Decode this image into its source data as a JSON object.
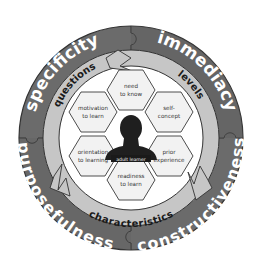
{
  "diagram": {
    "type": "concentric-circle-framework",
    "center_label": "adult learner",
    "outer_ring": {
      "segments": [
        {
          "label": "specificity",
          "position": "top-left"
        },
        {
          "label": "immediacy",
          "position": "top-right"
        },
        {
          "label": "constructiveness",
          "position": "bottom-right"
        },
        {
          "label": "purposefulness",
          "position": "bottom-left"
        }
      ]
    },
    "middle_ring": {
      "labels": [
        {
          "label": "questions",
          "position": "top-left"
        },
        {
          "label": "levels",
          "position": "top-right"
        },
        {
          "label": "characteristics",
          "position": "bottom"
        }
      ]
    },
    "hexagons": [
      {
        "line1": "need",
        "line2": "to know",
        "position": "top"
      },
      {
        "line1": "self-",
        "line2": "concept",
        "position": "upper-right"
      },
      {
        "line1": "prior",
        "line2": "experience",
        "position": "lower-right"
      },
      {
        "line1": "readiness",
        "line2": "to learn",
        "position": "bottom"
      },
      {
        "line1": "orientation",
        "line2": "to learning",
        "position": "lower-left"
      },
      {
        "line1": "motivation",
        "line2": "to learn",
        "position": "upper-left"
      }
    ],
    "colors": {
      "outer_ring": "#6e6e6e",
      "outer_ring_dark": "#555555",
      "middle_ring": "#c4c4c4",
      "inner_bg": "#ffffff",
      "hexagon_fill": "#f2f2f2",
      "hexagon_stroke": "#3a3a3a",
      "silhouette": "#222222",
      "outer_text": "#ffffff",
      "middle_text": "#1a1a1a"
    }
  }
}
